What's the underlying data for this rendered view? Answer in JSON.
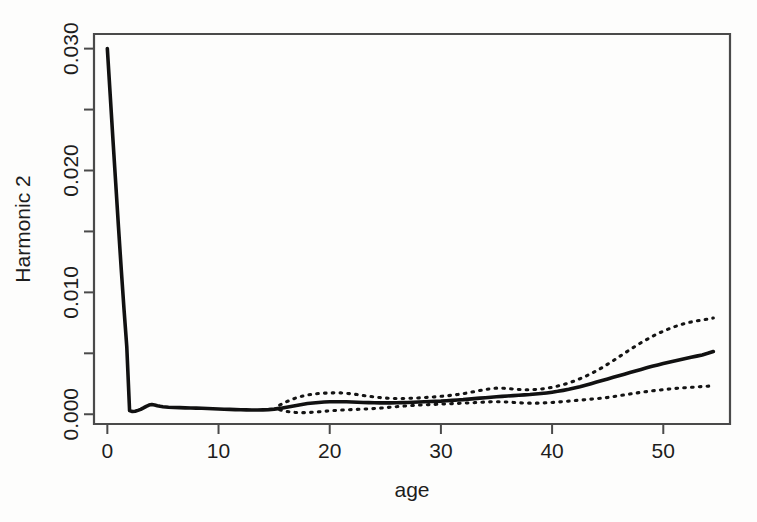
{
  "figure": {
    "background_color": "#fdfdfc",
    "plot_box": {
      "left": 94,
      "top": 34,
      "right": 730,
      "bottom": 424
    }
  },
  "chart_data": {
    "type": "line",
    "title": "",
    "subtitle": "",
    "xlabel": "age",
    "ylabel": "Harmonic 2",
    "xlim": [
      -1.2,
      56.0
    ],
    "ylim": [
      -0.0008,
      0.0312
    ],
    "grid": false,
    "legend": null,
    "x_ticks": [
      0,
      10,
      20,
      30,
      40,
      50
    ],
    "x_tick_labels": [
      "0",
      "10",
      "20",
      "30",
      "40",
      "50"
    ],
    "y_ticks": [
      0.0,
      0.005,
      0.01,
      0.015,
      0.02,
      0.025,
      0.03
    ],
    "y_tick_labels": [
      "0.000",
      "",
      "0.010",
      "",
      "0.020",
      "",
      "0.030"
    ],
    "y_major_tick_labels": [
      "0.000",
      "0.010",
      "0.020",
      "0.030"
    ],
    "line_color": "#111111",
    "ci_color": "#141414",
    "series": [
      {
        "name": "fit",
        "style": "solid",
        "x": [
          0,
          0.25,
          0.5,
          0.75,
          1.0,
          1.25,
          1.5,
          1.75,
          2.0,
          2.25,
          2.5,
          2.75,
          3.0,
          3.25,
          3.5,
          3.75,
          4.0,
          4.25,
          4.5,
          4.75,
          5.0,
          5.5,
          6.0,
          6.5,
          7.0,
          7.5,
          8.0,
          8.5,
          9.0,
          9.5,
          10.0,
          10.5,
          11.0,
          11.5,
          12.0,
          12.5,
          13.0,
          13.5,
          14.0,
          14.5,
          15.0,
          15.5,
          16.0,
          16.5,
          17.0,
          17.5,
          18.0,
          18.5,
          19.0,
          19.5,
          20.0,
          20.5,
          21.0,
          21.5,
          22.0,
          22.5,
          23.0,
          23.5,
          24.0,
          24.5,
          25.0,
          25.5,
          26.0,
          26.5,
          27.0,
          27.5,
          28.0,
          28.5,
          29.0,
          29.5,
          30.0,
          30.5,
          31.0,
          31.5,
          32.0,
          32.5,
          33.0,
          33.5,
          34.0,
          34.5,
          35.0,
          35.5,
          36.0,
          36.5,
          37.0,
          37.5,
          38.0,
          38.5,
          39.0,
          39.5,
          40.0,
          40.5,
          41.0,
          41.5,
          42.0,
          42.5,
          43.0,
          43.5,
          44.0,
          44.5,
          45.0,
          45.5,
          46.0,
          46.5,
          47.0,
          47.5,
          48.0,
          48.5,
          49.0,
          49.5,
          50.0,
          50.5,
          51.0,
          51.5,
          52.0,
          52.5,
          53.0,
          53.5,
          54.0,
          54.5
        ],
        "y": [
          0.03,
          0.0263,
          0.0226,
          0.019,
          0.0154,
          0.0119,
          0.0086,
          0.0055,
          0.0003,
          0.00022,
          0.00025,
          0.00032,
          0.0004,
          0.00052,
          0.00065,
          0.00075,
          0.0008,
          0.00076,
          0.0007,
          0.00065,
          0.00062,
          0.00058,
          0.00056,
          0.00054,
          0.00052,
          0.00051,
          0.0005,
          0.00049,
          0.00047,
          0.00045,
          0.00043,
          0.00041,
          0.0004,
          0.00038,
          0.00037,
          0.00036,
          0.00035,
          0.00035,
          0.00036,
          0.00038,
          0.00042,
          0.00048,
          0.00056,
          0.00064,
          0.00072,
          0.0008,
          0.00088,
          0.00093,
          0.00097,
          0.001,
          0.00102,
          0.00103,
          0.00103,
          0.00102,
          0.00101,
          0.00099,
          0.00097,
          0.00095,
          0.00094,
          0.00093,
          0.00093,
          0.00093,
          0.00094,
          0.00095,
          0.00096,
          0.00098,
          0.001,
          0.00102,
          0.00104,
          0.00106,
          0.00108,
          0.00111,
          0.00114,
          0.00117,
          0.0012,
          0.00124,
          0.00128,
          0.00132,
          0.00136,
          0.0014,
          0.00144,
          0.00147,
          0.0015,
          0.00153,
          0.00156,
          0.00159,
          0.00162,
          0.00166,
          0.0017,
          0.00175,
          0.00181,
          0.00188,
          0.00196,
          0.00205,
          0.00215,
          0.00226,
          0.00238,
          0.00251,
          0.00264,
          0.00277,
          0.0029,
          0.00303,
          0.00316,
          0.00329,
          0.00342,
          0.00355,
          0.00368,
          0.00381,
          0.00393,
          0.00405,
          0.00416,
          0.00427,
          0.00437,
          0.00447,
          0.00457,
          0.00467,
          0.00477,
          0.00487,
          0.005,
          0.00515
        ]
      },
      {
        "name": "upper_confidence_band",
        "style": "dotted",
        "x": [
          15.5,
          16.0,
          16.5,
          17.0,
          17.5,
          18.0,
          18.5,
          19.0,
          19.5,
          20.0,
          20.5,
          21.0,
          21.5,
          22.0,
          22.5,
          23.0,
          23.5,
          24.0,
          24.5,
          25.0,
          25.5,
          26.0,
          26.5,
          27.0,
          27.5,
          28.0,
          28.5,
          29.0,
          29.5,
          30.0,
          30.5,
          31.0,
          31.5,
          32.0,
          32.5,
          33.0,
          33.5,
          34.0,
          34.5,
          35.0,
          35.5,
          36.0,
          36.5,
          37.0,
          37.5,
          38.0,
          38.5,
          39.0,
          39.5,
          40.0,
          40.5,
          41.0,
          41.5,
          42.0,
          42.5,
          43.0,
          43.5,
          44.0,
          44.5,
          45.0,
          45.5,
          46.0,
          46.5,
          47.0,
          47.5,
          48.0,
          48.5,
          49.0,
          49.5,
          50.0,
          50.5,
          51.0,
          51.5,
          52.0,
          52.5,
          53.0,
          53.5,
          54.0,
          54.5
        ],
        "y": [
          0.00075,
          0.00098,
          0.00118,
          0.00135,
          0.00148,
          0.00158,
          0.00165,
          0.0017,
          0.00173,
          0.00175,
          0.00176,
          0.00175,
          0.00172,
          0.00167,
          0.00161,
          0.00154,
          0.00148,
          0.00142,
          0.00137,
          0.00133,
          0.0013,
          0.00129,
          0.00129,
          0.0013,
          0.00132,
          0.00134,
          0.00137,
          0.0014,
          0.00143,
          0.00147,
          0.00151,
          0.00156,
          0.00162,
          0.00169,
          0.00177,
          0.00186,
          0.00195,
          0.00203,
          0.0021,
          0.00214,
          0.00214,
          0.00211,
          0.00207,
          0.00203,
          0.00201,
          0.00201,
          0.00203,
          0.00207,
          0.00213,
          0.00221,
          0.00231,
          0.00243,
          0.00257,
          0.00273,
          0.00291,
          0.00311,
          0.00333,
          0.00357,
          0.00383,
          0.00411,
          0.0044,
          0.0047,
          0.005,
          0.0053,
          0.00559,
          0.00587,
          0.00613,
          0.00638,
          0.00661,
          0.00682,
          0.00701,
          0.00718,
          0.00733,
          0.00746,
          0.00757,
          0.00766,
          0.00774,
          0.0078,
          0.0079
        ]
      },
      {
        "name": "lower_confidence_band",
        "style": "dotted",
        "x": [
          15.5,
          16.0,
          16.5,
          17.0,
          17.5,
          18.0,
          18.5,
          19.0,
          19.5,
          20.0,
          20.5,
          21.0,
          21.5,
          22.0,
          22.5,
          23.0,
          23.5,
          24.0,
          24.5,
          25.0,
          25.5,
          26.0,
          26.5,
          27.0,
          27.5,
          28.0,
          28.5,
          29.0,
          29.5,
          30.0,
          30.5,
          31.0,
          31.5,
          32.0,
          32.5,
          33.0,
          33.5,
          34.0,
          34.5,
          35.0,
          35.5,
          36.0,
          36.5,
          37.0,
          37.5,
          38.0,
          38.5,
          39.0,
          39.5,
          40.0,
          40.5,
          41.0,
          41.5,
          42.0,
          42.5,
          43.0,
          43.5,
          44.0,
          44.5,
          45.0,
          45.5,
          46.0,
          46.5,
          47.0,
          47.5,
          48.0,
          48.5,
          49.0,
          49.5,
          50.0,
          50.5,
          51.0,
          51.5,
          52.0,
          52.5,
          53.0,
          53.5,
          54.0,
          54.5
        ],
        "y": [
          0.00037,
          0.00025,
          0.00018,
          0.00014,
          0.00013,
          0.00014,
          0.00017,
          0.0002,
          0.00024,
          0.00028,
          0.00031,
          0.00034,
          0.00036,
          0.00038,
          0.0004,
          0.00042,
          0.00044,
          0.00047,
          0.0005,
          0.00054,
          0.00058,
          0.00062,
          0.00066,
          0.00069,
          0.00072,
          0.00075,
          0.00077,
          0.00079,
          0.00081,
          0.00083,
          0.00085,
          0.00087,
          0.00089,
          0.00091,
          0.00093,
          0.00095,
          0.00098,
          0.001,
          0.00102,
          0.00103,
          0.00102,
          0.001,
          0.00097,
          0.00094,
          0.00092,
          0.00091,
          0.00091,
          0.00092,
          0.00094,
          0.00097,
          0.001,
          0.00104,
          0.00108,
          0.00112,
          0.00116,
          0.0012,
          0.00124,
          0.00128,
          0.00132,
          0.00138,
          0.00145,
          0.00152,
          0.00159,
          0.00166,
          0.00173,
          0.0018,
          0.00186,
          0.00192,
          0.00197,
          0.00202,
          0.00207,
          0.00211,
          0.00215,
          0.00218,
          0.00221,
          0.00224,
          0.00227,
          0.0023,
          0.00235
        ]
      }
    ]
  }
}
